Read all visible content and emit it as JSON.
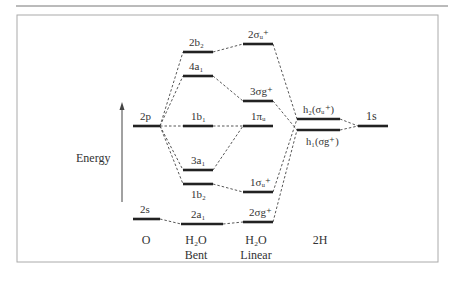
{
  "axis": {
    "label": "Energy"
  },
  "columns": [
    {
      "id": "O",
      "label": "O",
      "sublabel": ""
    },
    {
      "id": "H2O_bent",
      "label": "H₂O",
      "sublabel": "Bent"
    },
    {
      "id": "H2O_linear",
      "label": "H₂O",
      "sublabel": "Linear"
    },
    {
      "id": "2H",
      "label": "2H",
      "sublabel": ""
    }
  ],
  "levels": {
    "O": [
      {
        "name": "2p",
        "label": "2p"
      },
      {
        "name": "2s",
        "label": "2s"
      }
    ],
    "bent": [
      {
        "name": "2b2",
        "label": "2b₂"
      },
      {
        "name": "4a1",
        "label": "4a₁"
      },
      {
        "name": "1b1",
        "label": "1b₁"
      },
      {
        "name": "3a1",
        "label": "3a₁"
      },
      {
        "name": "1b2",
        "label": "1b₂"
      },
      {
        "name": "2a1",
        "label": "2a₁"
      }
    ],
    "linear": [
      {
        "name": "2sigma_u",
        "label": "2σᵤ⁺"
      },
      {
        "name": "3sigma_g",
        "label": "3σg⁺"
      },
      {
        "name": "1pi_u",
        "label": "1πᵤ"
      },
      {
        "name": "1sigma_u",
        "label": "1σᵤ⁺"
      },
      {
        "name": "2sigma_g",
        "label": "2σg⁺"
      }
    ],
    "H": [
      {
        "name": "h2",
        "label": "h₂(σᵤ⁺)"
      },
      {
        "name": "h1",
        "label": "h₁(σg⁺)"
      },
      {
        "name": "1s",
        "label": "1s"
      }
    ]
  }
}
